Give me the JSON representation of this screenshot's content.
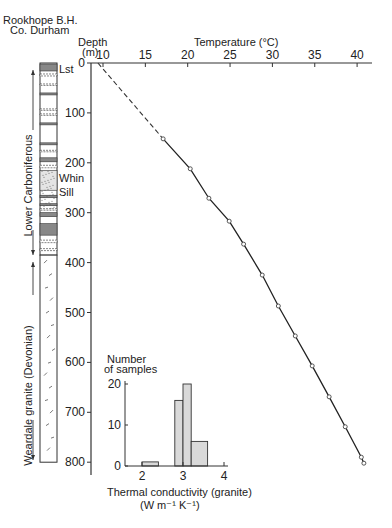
{
  "header": {
    "site_line1": "Rookhope B.H.",
    "site_line2": "Co. Durham"
  },
  "lithology": {
    "units": [
      {
        "label": "Lower Carboniferous",
        "from_m": 0,
        "to_m": 385
      },
      {
        "label": "Weardale granite (Devonian)",
        "from_m": 385,
        "to_m": 800
      }
    ],
    "annotations": [
      "Lst",
      "Whin",
      "Sill"
    ]
  },
  "chart_data": [
    {
      "type": "line",
      "title": "",
      "xlabel": "Temperature (°C)",
      "ylabel_line1": "Depth",
      "ylabel_line2": "(m)",
      "x_ticks": [
        10,
        15,
        20,
        25,
        30,
        35,
        40
      ],
      "y_ticks": [
        0,
        100,
        200,
        300,
        400,
        500,
        600,
        700,
        800
      ],
      "xlim": [
        8,
        42
      ],
      "ylim": [
        0,
        820
      ],
      "y_inverted": true,
      "x_axis_position": "top",
      "grid": false,
      "extrapolated_segment": {
        "style": "dashed",
        "points": [
          [
            9.4,
            0
          ],
          [
            17.1,
            152
          ]
        ]
      },
      "series": [
        {
          "name": "Measured temperature",
          "marker": "open-circle",
          "points": [
            {
              "temp_c": 17.1,
              "depth_m": 152
            },
            {
              "temp_c": 20.3,
              "depth_m": 212
            },
            {
              "temp_c": 22.5,
              "depth_m": 271
            },
            {
              "temp_c": 24.9,
              "depth_m": 317
            },
            {
              "temp_c": 26.6,
              "depth_m": 363
            },
            {
              "temp_c": 28.8,
              "depth_m": 425
            },
            {
              "temp_c": 30.7,
              "depth_m": 487
            },
            {
              "temp_c": 32.7,
              "depth_m": 547
            },
            {
              "temp_c": 34.7,
              "depth_m": 607
            },
            {
              "temp_c": 36.7,
              "depth_m": 669
            },
            {
              "temp_c": 38.6,
              "depth_m": 729
            },
            {
              "temp_c": 40.5,
              "depth_m": 790
            },
            {
              "temp_c": 40.8,
              "depth_m": 802
            }
          ]
        }
      ]
    },
    {
      "type": "bar",
      "subtype": "histogram",
      "ylabel_line1": "Number",
      "ylabel_line2": "of samples",
      "xlabel_line1": "Thermal conductivity (granite)",
      "xlabel_line2": "(W m⁻¹ K⁻¹)",
      "x_ticks": [
        2,
        3,
        4
      ],
      "y_ticks": [
        0,
        10,
        20
      ],
      "xlim": [
        1.6,
        4.0
      ],
      "ylim": [
        0,
        20
      ],
      "bins": [
        {
          "from": 2.0,
          "to": 2.4,
          "count": 1
        },
        {
          "from": 2.8,
          "to": 3.0,
          "count": 16
        },
        {
          "from": 3.0,
          "to": 3.2,
          "count": 20
        },
        {
          "from": 3.2,
          "to": 3.6,
          "count": 6
        }
      ],
      "fill_color": "#d9d9d9"
    }
  ]
}
